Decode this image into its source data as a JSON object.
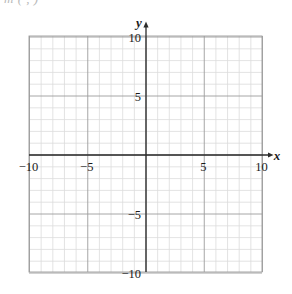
{
  "page": {
    "width": 292,
    "height": 294,
    "background_color": "#ffffff",
    "header_fragment_text": "m  ( , )"
  },
  "chart_data": {
    "type": "scatter",
    "title": "",
    "subtitle": "",
    "xlabel": "x",
    "ylabel": "y",
    "xlim": [
      -10,
      10
    ],
    "ylim": [
      -10,
      10
    ],
    "grid": true,
    "grid_minor_step": 1,
    "grid_major_step": 5,
    "legend": null,
    "series": [],
    "x_tick_labels": [
      "−10",
      "−5",
      "5",
      "10"
    ],
    "x_tick_values": [
      -10,
      -5,
      5,
      10
    ],
    "y_tick_labels": [
      "10",
      "5",
      "−5",
      "−10"
    ],
    "y_tick_values": [
      10,
      5,
      -5,
      -10
    ],
    "annotations": []
  },
  "colors": {
    "minor_grid": "#dcdcdc",
    "major_grid": "#9c9c9c",
    "axis": "#2b2b2b",
    "label_text": "#1a1a1a",
    "header_fragment": "#b9b9b9",
    "background": "#ffffff"
  },
  "geometry": {
    "plot_left": 29,
    "plot_right": 262,
    "plot_top": 36,
    "plot_bottom": 272,
    "origin_x": 146,
    "origin_y": 155,
    "unit_px_x": 11.65,
    "unit_px_y": 11.8,
    "x_arrow_tip": 274,
    "y_arrow_tip": 21
  },
  "axis_labels": {
    "x_axis_name": "x",
    "y_axis_name": "y"
  }
}
